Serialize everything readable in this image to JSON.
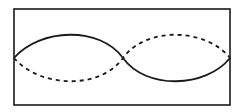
{
  "diagram": {
    "type": "standing-wave",
    "frame": {
      "x": 14,
      "y": 9,
      "width": 216,
      "height": 96,
      "stroke": "#1a1a1a"
    },
    "curves": [
      {
        "name": "solid-wave",
        "style": "solid",
        "color": "#1a1a1a",
        "path": "M14,58 C40,28 100,26 123,58 C146,90 206,88 230,58"
      },
      {
        "name": "dashed-wave",
        "style": "dashed",
        "color": "#1a1a1a",
        "path": "M14,58 C40,88 100,90 123,58 C146,26 206,28 230,58"
      }
    ]
  }
}
